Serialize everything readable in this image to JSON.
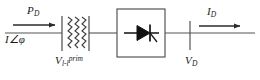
{
  "figure": {
    "kind": "single-line-circuit-diagram",
    "width": 260,
    "height": 80,
    "background_color": "#ffffff",
    "line_color": "#3a3a3a",
    "text_color": "#1a1a1a"
  },
  "labels": {
    "input_power": {
      "symbol": "P",
      "sub": "D",
      "full": "P_D"
    },
    "input_current_phasor": {
      "symbol": "I",
      "angle_glyph": "∠",
      "phase": "φ",
      "full": "I∠φ"
    },
    "transformer_voltage": {
      "symbol": "V",
      "sub": "l-l",
      "sup": "prim",
      "full": "V_l-l^prim"
    },
    "output_current": {
      "symbol": "I",
      "sub": "D",
      "full": "I_D"
    },
    "output_voltage": {
      "symbol": "V",
      "sub": "D",
      "full": "V_D"
    }
  },
  "components": {
    "transformer": {
      "name": "transformer-winding",
      "bars": 2,
      "zigzags": 3
    },
    "converter": {
      "name": "rectifier-block",
      "inner_symbol": "thyristor-diode"
    },
    "bus_bars": {
      "name": "bus-bar",
      "count": 3
    }
  },
  "arrows": {
    "power_flow": {
      "name": "power-flow-arrow",
      "direction": "right"
    },
    "current_flow": {
      "name": "current-flow-arrow",
      "direction": "right"
    }
  }
}
